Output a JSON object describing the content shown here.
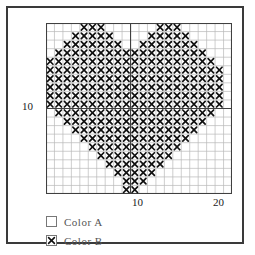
{
  "chart_data": {
    "type": "heatmap",
    "title": "",
    "xlabel": "",
    "ylabel": "",
    "grid": true,
    "cols": 22,
    "rows": 20,
    "xlim": [
      0,
      22
    ],
    "ylim": [
      0,
      20
    ],
    "xticks": [
      {
        "value": 10,
        "label": "10"
      },
      {
        "value": 20,
        "label": "20"
      }
    ],
    "yticks": [
      {
        "value": 10,
        "label": "10"
      }
    ],
    "major_gridlines": {
      "x": [
        10
      ],
      "y": [
        10
      ]
    },
    "legend": {
      "position": "below",
      "entries": [
        {
          "symbol": "empty",
          "label": "Color A",
          "color": "#ffffff"
        },
        {
          "symbol": "cross",
          "label": "Color B",
          "color": "#000000"
        }
      ]
    },
    "filled_rows": [
      {
        "row": 1,
        "spans": [
          [
            5,
            7
          ],
          [
            14,
            16
          ]
        ]
      },
      {
        "row": 2,
        "spans": [
          [
            4,
            8
          ],
          [
            13,
            17
          ]
        ]
      },
      {
        "row": 3,
        "spans": [
          [
            3,
            9
          ],
          [
            12,
            18
          ]
        ]
      },
      {
        "row": 4,
        "spans": [
          [
            2,
            19
          ]
        ]
      },
      {
        "row": 5,
        "spans": [
          [
            1,
            20
          ]
        ]
      },
      {
        "row": 6,
        "spans": [
          [
            1,
            21
          ]
        ]
      },
      {
        "row": 7,
        "spans": [
          [
            1,
            21
          ]
        ]
      },
      {
        "row": 8,
        "spans": [
          [
            1,
            21
          ]
        ]
      },
      {
        "row": 9,
        "spans": [
          [
            1,
            21
          ]
        ]
      },
      {
        "row": 10,
        "spans": [
          [
            1,
            21
          ]
        ]
      },
      {
        "row": 11,
        "spans": [
          [
            2,
            20
          ]
        ]
      },
      {
        "row": 12,
        "spans": [
          [
            3,
            19
          ]
        ]
      },
      {
        "row": 13,
        "spans": [
          [
            4,
            18
          ]
        ]
      },
      {
        "row": 14,
        "spans": [
          [
            5,
            17
          ]
        ]
      },
      {
        "row": 15,
        "spans": [
          [
            6,
            16
          ]
        ]
      },
      {
        "row": 16,
        "spans": [
          [
            7,
            15
          ]
        ]
      },
      {
        "row": 17,
        "spans": [
          [
            8,
            14
          ]
        ]
      },
      {
        "row": 18,
        "spans": [
          [
            9,
            13
          ]
        ]
      },
      {
        "row": 19,
        "spans": [
          [
            10,
            12
          ]
        ]
      },
      {
        "row": 20,
        "spans": [
          [
            10,
            11
          ]
        ]
      }
    ],
    "colors": {
      "grid_minor": "#b9b9b9",
      "grid_major": "#404040",
      "cell_fill": "#ffffff",
      "mark": "#111111",
      "frame": "#3a3a3a",
      "axis_text": "#1a1a1a",
      "legend_text": "#555555"
    }
  }
}
